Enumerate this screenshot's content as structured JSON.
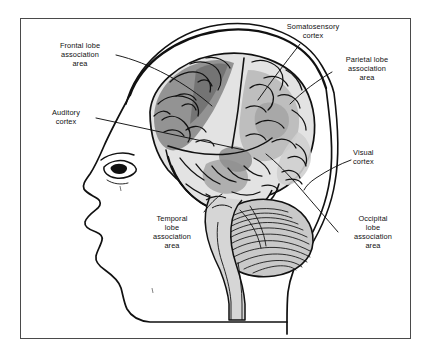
{
  "figure": {
    "background_color": "#ffffff",
    "frame_color": "#4a4a4a"
  },
  "palette": {
    "outline": "#111111",
    "cortex_light": "#e3e3e3",
    "cortex_mid": "#bcbcbc",
    "cortex_dark": "#8e8e8e",
    "cortex_darkest": "#6f6f6f",
    "cerebellum": "#c9c9c9",
    "brainstem": "#d6d6d6",
    "skin": "#ffffff"
  },
  "labels": [
    {
      "id": "frontal",
      "name": "frontal-lobe-association-area",
      "text": "Frontal lobe\nassociation\narea",
      "align": "center"
    },
    {
      "id": "somatosensory",
      "name": "somatosensory-cortex",
      "text": "Somatosensory\ncortex",
      "align": "center"
    },
    {
      "id": "parietal",
      "name": "parietal-lobe-association-area",
      "text": "Parietal lobe\nassociation\narea",
      "align": "center"
    },
    {
      "id": "auditory",
      "name": "auditory-cortex",
      "text": "Auditory\ncortex",
      "align": "center"
    },
    {
      "id": "visual",
      "name": "visual-cortex",
      "text": "Visual\ncortex",
      "align": "left"
    },
    {
      "id": "temporal",
      "name": "temporal-lobe-association-area",
      "text": "Temporal\nlobe\nassociation\narea",
      "align": "center"
    },
    {
      "id": "occipital",
      "name": "occipital-lobe-association-area",
      "text": "Occipital\nlobe\nassociation\narea",
      "align": "center"
    }
  ],
  "anatomy_parts": [
    "head-profile-outline",
    "skull-outline",
    "eye",
    "nose",
    "lips",
    "chin",
    "cerebral-cortex",
    "frontal-lobe",
    "parietal-lobe",
    "temporal-lobe",
    "occipital-lobe",
    "cerebellum",
    "brainstem",
    "lateral-sulcus",
    "central-sulcus"
  ]
}
